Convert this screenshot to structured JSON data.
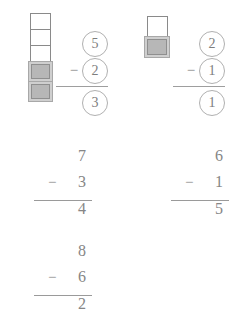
{
  "worksheet": {
    "background_color": "#ffffff",
    "ink_color": "#7a7a7a",
    "cube_fill_color": "#b7b7b7",
    "cube_outline_color": "#8a8a8a",
    "minus_sign": "−"
  },
  "problems": [
    {
      "id": "circled-problem-left",
      "style": "circled-with-cube-tower",
      "minuend": "5",
      "subtrahend": "2",
      "difference": "3",
      "operator": "−",
      "cube_tower": {
        "open_cubes": 3,
        "filled_cubes": 2,
        "total_cubes": 5
      }
    },
    {
      "id": "circled-problem-right",
      "style": "circled-with-cube-tower",
      "minuend": "2",
      "subtrahend": "1",
      "difference": "1",
      "operator": "−",
      "cube_tower": {
        "open_cubes": 1,
        "filled_cubes": 1,
        "total_cubes": 2
      }
    },
    {
      "id": "written-problem-middle-left",
      "style": "plain-vertical",
      "minuend": "7",
      "subtrahend": "3",
      "difference": "4",
      "operator": "−"
    },
    {
      "id": "written-problem-middle-right",
      "style": "plain-vertical",
      "minuend": "6",
      "subtrahend": "1",
      "difference": "5",
      "operator": "−"
    },
    {
      "id": "written-problem-bottom-left",
      "style": "plain-vertical",
      "minuend": "8",
      "subtrahend": "6",
      "difference": "2",
      "operator": "−"
    }
  ]
}
